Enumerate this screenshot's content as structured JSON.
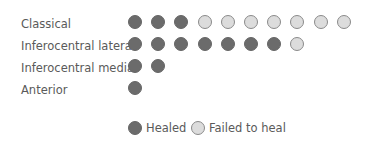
{
  "chart_data": {
    "type": "table",
    "title": "",
    "categories": [
      "Classical",
      "Inferocentral lateral",
      "Inferocentral medial",
      "Anterior"
    ],
    "series": [
      {
        "name": "Healed",
        "values": [
          3,
          7,
          2,
          1
        ],
        "color": "#6b6b6b"
      },
      {
        "name": "Failed to heal",
        "values": [
          7,
          1,
          0,
          0
        ],
        "color": "#dcdcdc"
      }
    ],
    "rows": [
      {
        "label": "Classical",
        "dots": [
          "healed",
          "healed",
          "healed",
          "failed",
          "failed",
          "failed",
          "failed",
          "failed",
          "failed",
          "failed"
        ]
      },
      {
        "label": "Inferocentral lateral",
        "dots": [
          "healed",
          "healed",
          "healed",
          "healed",
          "healed",
          "healed",
          "healed",
          "failed"
        ]
      },
      {
        "label": "Inferocentral medial",
        "dots": [
          "healed",
          "healed"
        ]
      },
      {
        "label": "Anterior",
        "dots": [
          "healed"
        ]
      }
    ],
    "legend": [
      {
        "label": "Healed",
        "kind": "healed"
      },
      {
        "label": "Failed to heal",
        "kind": "failed"
      }
    ],
    "legend_position": "bottom",
    "grid": false
  }
}
